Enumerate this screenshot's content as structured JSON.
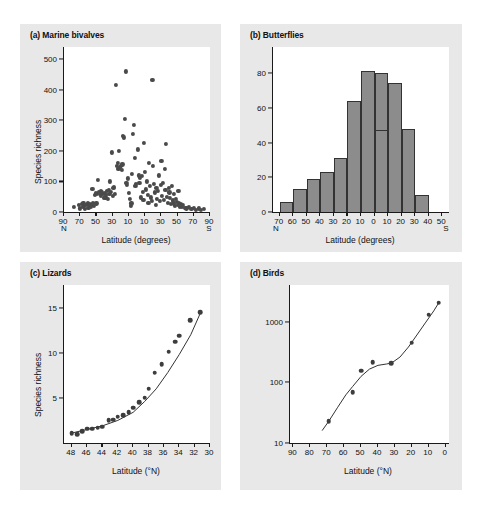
{
  "figure": {
    "background": "#ffffff",
    "panel_background": "#e8e8e8",
    "plot_background": "#ffffff",
    "marker_color": "#4a4a4a",
    "bar_fill": "#8c8c8c",
    "bar_stroke": "#333333",
    "axis_color": "#1a1a1a"
  },
  "panels": {
    "a": {
      "title": "(a) Marine bivalves",
      "ylabel": "Species richness",
      "xlabel": "Latitude (degrees)",
      "pole_left": "N",
      "pole_right": "S",
      "yticks": [
        0,
        100,
        200,
        300,
        400,
        500
      ],
      "ylim": [
        0,
        540
      ],
      "xticks": [
        "90",
        "70",
        "50",
        "30",
        "10",
        "10",
        "30",
        "50",
        "70",
        "90"
      ],
      "xlim": [
        -90,
        90
      ]
    },
    "b": {
      "title": "(b) Butterflies",
      "ylabel": "",
      "xlabel": "Latitude (degrees)",
      "pole_left": "N",
      "pole_right": "S",
      "yticks": [
        0,
        20,
        40,
        60,
        80
      ],
      "ylim": [
        0,
        95
      ],
      "xticks": [
        "70",
        "60",
        "50",
        "40",
        "30",
        "20",
        "10",
        "0",
        "10",
        "20",
        "30",
        "40",
        "50"
      ],
      "xlim": [
        -75,
        55
      ]
    },
    "c": {
      "title": "(c) Lizards",
      "ylabel": "Species richness",
      "xlabel": "Latitude (°N)",
      "yticks": [
        5,
        10,
        15
      ],
      "ylim": [
        0,
        17.5
      ],
      "xticks": [
        "48",
        "46",
        "44",
        "42",
        "40",
        "38",
        "36",
        "34",
        "32",
        "30"
      ],
      "xlim": [
        49,
        30
      ]
    },
    "d": {
      "title": "(d) Birds",
      "ylabel": "",
      "xlabel": "Latitude (°N)",
      "yticks": [
        "10",
        "100",
        "1000"
      ],
      "ylim_log": [
        10,
        4000
      ],
      "xticks": [
        "90",
        "80",
        "70",
        "60",
        "50",
        "40",
        "30",
        "20",
        "10",
        "0"
      ],
      "xlim": [
        92,
        -2
      ]
    }
  },
  "chart_data": [
    {
      "id": "a",
      "type": "scatter",
      "title": "(a) Marine bivalves",
      "xlabel": "Latitude (degrees)",
      "ylabel": "Species richness",
      "xlim": [
        -90,
        90
      ],
      "ylim": [
        0,
        540
      ],
      "xtick_labels": [
        "90",
        "70",
        "50",
        "30",
        "10",
        "10",
        "30",
        "50",
        "70",
        "90"
      ],
      "xtick_values": [
        -90,
        -70,
        -50,
        -30,
        -10,
        10,
        30,
        50,
        70,
        90
      ],
      "ytick_values": [
        0,
        100,
        200,
        300,
        400,
        500
      ],
      "note": "x negative = Northern hemisphere, positive = Southern hemisphere",
      "grid": false,
      "legend": "none",
      "points": [
        [
          -78,
          18
        ],
        [
          -72,
          22
        ],
        [
          -70,
          12
        ],
        [
          -68,
          26
        ],
        [
          -67,
          16
        ],
        [
          -66,
          30
        ],
        [
          -65,
          20
        ],
        [
          -64,
          10
        ],
        [
          -63,
          24
        ],
        [
          -61,
          28
        ],
        [
          -60,
          14
        ],
        [
          -59,
          22
        ],
        [
          -58,
          26
        ],
        [
          -57,
          18
        ],
        [
          -56,
          24
        ],
        [
          -55,
          75
        ],
        [
          -54,
          30
        ],
        [
          -53,
          20
        ],
        [
          -52,
          55
        ],
        [
          -51,
          62
        ],
        [
          -50,
          28
        ],
        [
          -49,
          58
        ],
        [
          -48,
          104
        ],
        [
          -47,
          66
        ],
        [
          -46,
          60
        ],
        [
          -45,
          70
        ],
        [
          -44,
          52
        ],
        [
          -43,
          64
        ],
        [
          -42,
          58
        ],
        [
          -41,
          46
        ],
        [
          -40,
          62
        ],
        [
          -39,
          48
        ],
        [
          -38,
          56
        ],
        [
          -37,
          68
        ],
        [
          -36,
          44
        ],
        [
          -35,
          72
        ],
        [
          -34,
          60
        ],
        [
          -33,
          100
        ],
        [
          -32,
          66
        ],
        [
          -31,
          195
        ],
        [
          -30,
          54
        ],
        [
          -29,
          80
        ],
        [
          -28,
          82
        ],
        [
          -27,
          58
        ],
        [
          -26,
          415
        ],
        [
          -25,
          150
        ],
        [
          -24,
          160
        ],
        [
          -23,
          140
        ],
        [
          -22,
          200
        ],
        [
          -21,
          146
        ],
        [
          -20,
          152
        ],
        [
          -19,
          138
        ],
        [
          -18,
          156
        ],
        [
          -17,
          250
        ],
        [
          -16,
          244
        ],
        [
          -15,
          306
        ],
        [
          -14,
          460
        ],
        [
          -13,
          96
        ],
        [
          -12,
          90
        ],
        [
          -11,
          110
        ],
        [
          -10,
          62
        ],
        [
          -9,
          44
        ],
        [
          -8,
          20
        ],
        [
          -7,
          28
        ],
        [
          -6,
          126
        ],
        [
          -5,
          256
        ],
        [
          -4,
          285
        ],
        [
          -3,
          176
        ],
        [
          -2,
          86
        ],
        [
          -1,
          92
        ],
        [
          1,
          205
        ],
        [
          2,
          120
        ],
        [
          3,
          96
        ],
        [
          4,
          112
        ],
        [
          5,
          48
        ],
        [
          6,
          118
        ],
        [
          7,
          66
        ],
        [
          8,
          40
        ],
        [
          9,
          225
        ],
        [
          10,
          130
        ],
        [
          11,
          74
        ],
        [
          12,
          100
        ],
        [
          13,
          56
        ],
        [
          14,
          30
        ],
        [
          15,
          160
        ],
        [
          16,
          85
        ],
        [
          17,
          48
        ],
        [
          18,
          36
        ],
        [
          19,
          432
        ],
        [
          20,
          150
        ],
        [
          21,
          92
        ],
        [
          22,
          64
        ],
        [
          23,
          24
        ],
        [
          24,
          78
        ],
        [
          25,
          44
        ],
        [
          26,
          70
        ],
        [
          27,
          120
        ],
        [
          28,
          36
        ],
        [
          29,
          88
        ],
        [
          30,
          166
        ],
        [
          31,
          54
        ],
        [
          32,
          96
        ],
        [
          33,
          40
        ],
        [
          34,
          142
        ],
        [
          35,
          72
        ],
        [
          36,
          224
        ],
        [
          37,
          50
        ],
        [
          38,
          30
        ],
        [
          39,
          80
        ],
        [
          40,
          64
        ],
        [
          41,
          46
        ],
        [
          42,
          26
        ],
        [
          43,
          86
        ],
        [
          44,
          38
        ],
        [
          45,
          28
        ],
        [
          46,
          60
        ],
        [
          47,
          20
        ],
        [
          48,
          44
        ],
        [
          49,
          32
        ],
        [
          50,
          24
        ],
        [
          51,
          70
        ],
        [
          52,
          30
        ],
        [
          53,
          16
        ],
        [
          54,
          26
        ],
        [
          55,
          18
        ],
        [
          57,
          22
        ],
        [
          59,
          14
        ],
        [
          61,
          12
        ],
        [
          64,
          18
        ],
        [
          67,
          10
        ],
        [
          70,
          14
        ],
        [
          73,
          8
        ],
        [
          76,
          12
        ],
        [
          79,
          6
        ],
        [
          82,
          10
        ]
      ]
    },
    {
      "id": "b",
      "type": "bar",
      "title": "(b) Butterflies",
      "xlabel": "Latitude (degrees)",
      "ylabel": "",
      "xlim": [
        -75,
        55
      ],
      "ylim": [
        0,
        95
      ],
      "ytick_values": [
        0,
        20,
        40,
        60,
        80
      ],
      "xtick_labels": [
        "70",
        "60",
        "50",
        "40",
        "30",
        "20",
        "10",
        "0",
        "10",
        "20",
        "30",
        "40",
        "50"
      ],
      "xtick_values": [
        -70,
        -60,
        -50,
        -40,
        -30,
        -20,
        -10,
        0,
        10,
        20,
        30,
        40,
        50
      ],
      "grid": false,
      "legend": "none",
      "bin_width": 10,
      "bins": [
        {
          "start": -70,
          "end": -60,
          "value": 6
        },
        {
          "start": -60,
          "end": -50,
          "value": 13
        },
        {
          "start": -50,
          "end": -40,
          "value": 19
        },
        {
          "start": -40,
          "end": -30,
          "value": 23
        },
        {
          "start": -30,
          "end": -20,
          "value": 31
        },
        {
          "start": -20,
          "end": -10,
          "value": 64
        },
        {
          "start": -10,
          "end": 0,
          "value": 81
        },
        {
          "start": 0,
          "end": 10,
          "value": 80,
          "inner_line": 48
        },
        {
          "start": 10,
          "end": 20,
          "value": 74
        },
        {
          "start": 20,
          "end": 30,
          "value": 48
        },
        {
          "start": 30,
          "end": 40,
          "value": 10
        }
      ]
    },
    {
      "id": "c",
      "type": "scatter",
      "title": "(c) Lizards",
      "xlabel": "Latitude (°N)",
      "ylabel": "Species richness",
      "xlim": [
        49,
        30
      ],
      "ylim": [
        0,
        17.5
      ],
      "ytick_values": [
        5,
        10,
        15
      ],
      "xtick_values": [
        48,
        46,
        44,
        42,
        40,
        38,
        36,
        34,
        32,
        30
      ],
      "grid": false,
      "legend": "none",
      "has_fit_curve": true,
      "points": [
        [
          48.0,
          1.1
        ],
        [
          47.3,
          1.0
        ],
        [
          46.6,
          1.3
        ],
        [
          46.0,
          1.6
        ],
        [
          45.3,
          1.6
        ],
        [
          44.6,
          1.7
        ],
        [
          44.0,
          1.8
        ],
        [
          43.2,
          2.5
        ],
        [
          42.6,
          2.6
        ],
        [
          42.0,
          2.9
        ],
        [
          41.3,
          3.1
        ],
        [
          40.6,
          3.4
        ],
        [
          40.0,
          3.9
        ],
        [
          39.2,
          4.5
        ],
        [
          38.5,
          5.0
        ],
        [
          38.0,
          6.0
        ],
        [
          37.2,
          7.8
        ],
        [
          36.3,
          8.7
        ],
        [
          35.4,
          10.1
        ],
        [
          34.5,
          11.2
        ],
        [
          34.0,
          11.9
        ],
        [
          32.6,
          13.6
        ],
        [
          31.3,
          14.5
        ]
      ],
      "fit_curve": [
        [
          48.0,
          1.1
        ],
        [
          46.0,
          1.5
        ],
        [
          44.0,
          1.9
        ],
        [
          42.0,
          2.5
        ],
        [
          40.0,
          3.4
        ],
        [
          38.5,
          4.6
        ],
        [
          37.0,
          6.0
        ],
        [
          35.5,
          7.8
        ],
        [
          34.0,
          9.8
        ],
        [
          32.5,
          12.0
        ],
        [
          31.3,
          14.3
        ]
      ]
    },
    {
      "id": "d",
      "type": "scatter",
      "title": "(d) Birds",
      "xlabel": "Latitude (°N)",
      "ylabel": "",
      "xlim": [
        92,
        -2
      ],
      "yscale": "log",
      "ylim": [
        10,
        4000
      ],
      "ytick_values": [
        10,
        100,
        1000
      ],
      "xtick_values": [
        90,
        80,
        70,
        60,
        50,
        40,
        30,
        20,
        10,
        0
      ],
      "grid": false,
      "legend": "none",
      "has_fit_curve": true,
      "points": [
        [
          69,
          23
        ],
        [
          55,
          68
        ],
        [
          50,
          155
        ],
        [
          43,
          215
        ],
        [
          32,
          205
        ],
        [
          20,
          450
        ],
        [
          10,
          1300
        ],
        [
          4,
          2050
        ]
      ],
      "fit_curve": [
        [
          73,
          16
        ],
        [
          69,
          23
        ],
        [
          64,
          38
        ],
        [
          59,
          62
        ],
        [
          55,
          85
        ],
        [
          50,
          125
        ],
        [
          45,
          165
        ],
        [
          40,
          190
        ],
        [
          35,
          200
        ],
        [
          32,
          207
        ],
        [
          27,
          260
        ],
        [
          22,
          380
        ],
        [
          17,
          600
        ],
        [
          12,
          950
        ],
        [
          7,
          1500
        ],
        [
          4,
          2050
        ]
      ]
    }
  ]
}
